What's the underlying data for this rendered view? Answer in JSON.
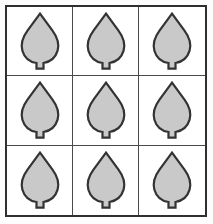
{
  "figure": {
    "background_color": "#fdfdfd"
  },
  "grid": {
    "rows": 3,
    "columns": 3,
    "cell_count": 9,
    "frame_border_color": "#2f2f2f",
    "frame_border_width_px": 2,
    "inner_line_color": "#4a4a4a",
    "inner_line_width_px": 1,
    "cell_background": "#ffffff"
  },
  "leaf": {
    "shape_name": "leaf",
    "fill_color": "#c9c9c9",
    "outline_color": "#333333",
    "outline_width_px": 2,
    "has_stem": true,
    "apex": "pointed-top",
    "body": "rounded-bottom"
  },
  "cells": [
    {
      "row": 1,
      "column": 1,
      "position": "top-left",
      "icon": "leaf-icon"
    },
    {
      "row": 1,
      "column": 2,
      "position": "top-center",
      "icon": "leaf-icon"
    },
    {
      "row": 1,
      "column": 3,
      "position": "top-right",
      "icon": "leaf-icon"
    },
    {
      "row": 2,
      "column": 1,
      "position": "middle-left",
      "icon": "leaf-icon"
    },
    {
      "row": 2,
      "column": 2,
      "position": "middle-center",
      "icon": "leaf-icon"
    },
    {
      "row": 2,
      "column": 3,
      "position": "middle-right",
      "icon": "leaf-icon"
    },
    {
      "row": 3,
      "column": 1,
      "position": "bottom-left",
      "icon": "leaf-icon"
    },
    {
      "row": 3,
      "column": 2,
      "position": "bottom-center",
      "icon": "leaf-icon"
    },
    {
      "row": 3,
      "column": 3,
      "position": "bottom-right",
      "icon": "leaf-icon"
    }
  ]
}
